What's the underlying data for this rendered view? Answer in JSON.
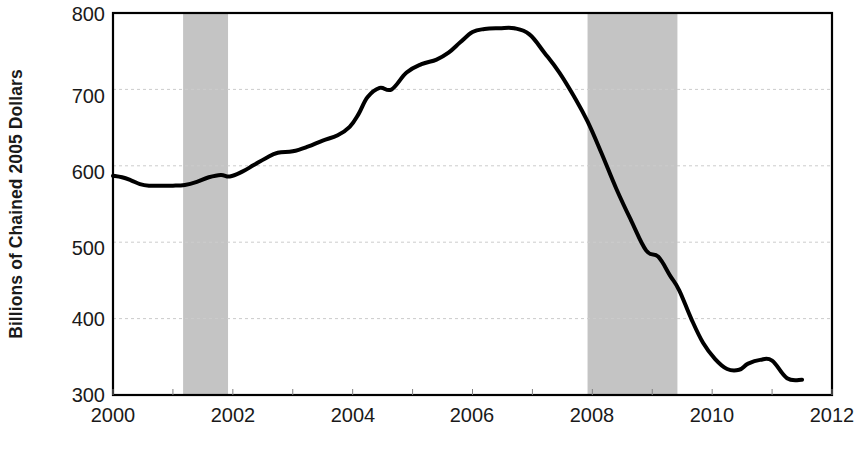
{
  "chart_data": {
    "type": "line",
    "title": "",
    "subtitle": "",
    "xlabel": "",
    "ylabel": "Billions of Chained 2005 Dollars",
    "xlim": [
      2000,
      2012
    ],
    "ylim": [
      300,
      800
    ],
    "grid": true,
    "grid_axis": "y",
    "legend": "none",
    "line_color": "#000000",
    "line_width": 4,
    "background_color": "#ffffff",
    "plot_border_color": "#000000",
    "gridline_color": "#cccccc",
    "y_ticks": [
      300,
      400,
      500,
      600,
      700,
      800
    ],
    "y_tick_labels": [
      "300",
      "400",
      "500",
      "600",
      "700",
      "800"
    ],
    "x_ticks": [
      2000,
      2001,
      2002,
      2003,
      2004,
      2005,
      2006,
      2007,
      2008,
      2009,
      2010,
      2011,
      2012
    ],
    "x_tick_labels_shown": [
      "2000",
      "2002",
      "2004",
      "2006",
      "2008",
      "2010",
      "2012"
    ],
    "x_tick_label_values": [
      2000,
      2002,
      2004,
      2006,
      2008,
      2010,
      2012
    ],
    "shaded_regions": [
      {
        "name": "recession-2001",
        "start": 2001.17,
        "end": 2001.92,
        "color": "#c4c4c4"
      },
      {
        "name": "recession-2008",
        "start": 2007.92,
        "end": 2009.42,
        "color": "#c4c4c4"
      }
    ],
    "series": [
      {
        "name": "Real Residential Fixed Investment",
        "color": "#000000",
        "x": [
          2000.0,
          2000.15,
          2000.3,
          2000.45,
          2000.6,
          2000.8,
          2001.0,
          2001.2,
          2001.4,
          2001.6,
          2001.8,
          2001.95,
          2002.15,
          2002.35,
          2002.55,
          2002.75,
          2003.0,
          2003.25,
          2003.5,
          2003.75,
          2003.95,
          2004.1,
          2004.25,
          2004.45,
          2004.65,
          2004.9,
          2005.15,
          2005.4,
          2005.6,
          2005.8,
          2006.0,
          2006.2,
          2006.45,
          2006.7,
          2006.95,
          2007.2,
          2007.45,
          2007.7,
          2007.92,
          2008.15,
          2008.4,
          2008.65,
          2008.9,
          2009.1,
          2009.3,
          2009.45,
          2009.65,
          2009.85,
          2010.05,
          2010.25,
          2010.45,
          2010.6,
          2010.8,
          2011.0,
          2011.25,
          2011.5
        ],
        "y": [
          587,
          585,
          581,
          576,
          574,
          574,
          574,
          575,
          579,
          585,
          588,
          586,
          592,
          601,
          610,
          617,
          619,
          625,
          633,
          640,
          651,
          668,
          690,
          702,
          700,
          722,
          733,
          739,
          748,
          762,
          775,
          779,
          780,
          780,
          772,
          748,
          722,
          690,
          658,
          617,
          570,
          528,
          489,
          481,
          456,
          437,
          400,
          368,
          347,
          334,
          333,
          341,
          346,
          345,
          322,
          320
        ]
      }
    ],
    "annotations": []
  },
  "axis": {
    "y_title": "Billions of Chained 2005 Dollars",
    "y_tick_800": "800",
    "y_tick_700": "700",
    "y_tick_600": "600",
    "y_tick_500": "500",
    "y_tick_400": "400",
    "y_tick_300": "300",
    "x_tick_2000": "2000",
    "x_tick_2002": "2002",
    "x_tick_2004": "2004",
    "x_tick_2006": "2006",
    "x_tick_2008": "2008",
    "x_tick_2010": "2010",
    "x_tick_2012": "2012"
  }
}
